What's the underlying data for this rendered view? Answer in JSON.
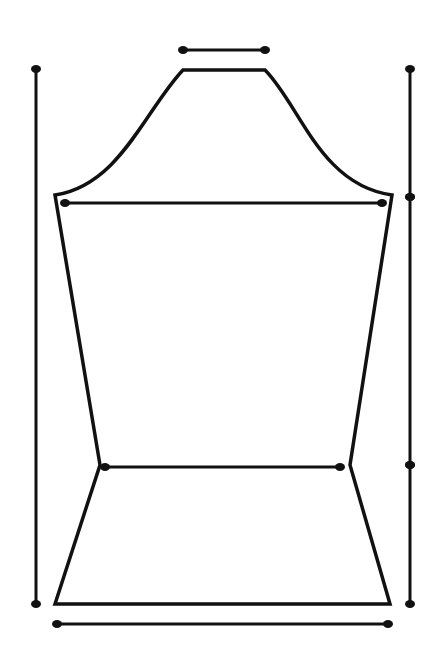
{
  "diagram": {
    "title": "",
    "background": "#ffffff",
    "stroke_color": "#111111",
    "outline_width": 3.5,
    "measure_width": 3,
    "dot_rx": 5,
    "dot_ry": 4,
    "sleeve_outline": {
      "cap_top_left": [
        183,
        70
      ],
      "cap_top_right": [
        265,
        70
      ],
      "armhole_left": [
        55,
        195
      ],
      "armhole_right": [
        392,
        195
      ],
      "elbow_left": [
        100,
        465
      ],
      "elbow_right": [
        350,
        465
      ],
      "hem_left": [
        55,
        604
      ],
      "hem_right": [
        390,
        604
      ]
    },
    "measurements": [
      {
        "name": "cap-width-line",
        "x1": 183,
        "y1": 50,
        "x2": 265,
        "y2": 50
      },
      {
        "name": "bicep-width-line",
        "x1": 65,
        "y1": 203,
        "x2": 382,
        "y2": 203
      },
      {
        "name": "elbow-width-line",
        "x1": 105,
        "y1": 467,
        "x2": 340,
        "y2": 467
      },
      {
        "name": "hem-width-line",
        "x1": 57,
        "y1": 624,
        "x2": 388,
        "y2": 624
      },
      {
        "name": "total-length-line",
        "x1": 36,
        "y1": 69,
        "x2": 36,
        "y2": 604
      },
      {
        "name": "cap-height-line",
        "x1": 410,
        "y1": 69,
        "x2": 410,
        "y2": 197
      },
      {
        "name": "upper-arm-length-line",
        "x1": 410,
        "y1": 197,
        "x2": 410,
        "y2": 465
      },
      {
        "name": "lower-arm-length-line",
        "x1": 410,
        "y1": 465,
        "x2": 410,
        "y2": 604
      }
    ]
  }
}
